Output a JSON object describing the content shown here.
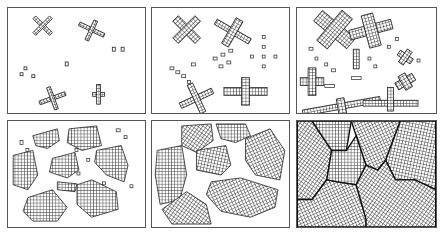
{
  "figure": {
    "panels": [
      {
        "id": 1,
        "stage": "nucleation",
        "row": 1,
        "col": 1
      },
      {
        "id": 2,
        "stage": "early growth",
        "row": 1,
        "col": 2
      },
      {
        "id": 3,
        "stage": "dendritic growth",
        "row": 1,
        "col": 3
      },
      {
        "id": 4,
        "stage": "grain coarsening",
        "row": 2,
        "col": 1
      },
      {
        "id": 5,
        "stage": "grain impingement",
        "row": 2,
        "col": 2
      },
      {
        "id": 6,
        "stage": "fully solidified polycrystal with grain boundaries",
        "row": 2,
        "col": 3
      }
    ],
    "colors": {
      "lattice": "#222222",
      "background": "#ffffff",
      "border": "#555555"
    }
  }
}
